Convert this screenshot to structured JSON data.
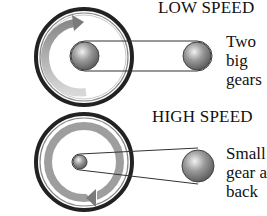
{
  "panels": [
    {
      "title": "LOW SPEED",
      "caption_lines": [
        "Two",
        "big",
        "gears"
      ],
      "front_gear": "big",
      "rear_gear": "big"
    },
    {
      "title": "HIGH SPEED",
      "caption_lines": [
        "Small",
        "gear a",
        "back"
      ],
      "front_gear": "small",
      "rear_gear": "big"
    }
  ],
  "colors": {
    "tire": "#2a2a2a",
    "arrow": "#9a9a9a",
    "chain": "#333333"
  }
}
